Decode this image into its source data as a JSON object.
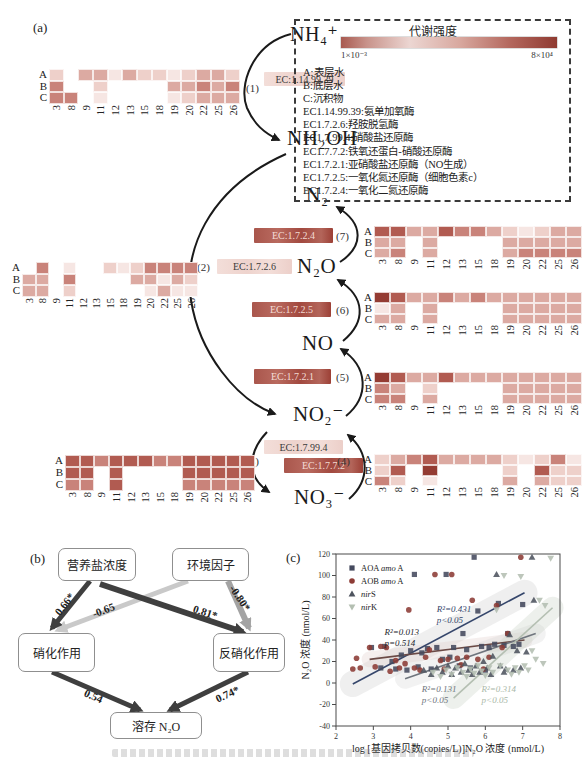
{
  "figure": {
    "label_a": "(a)",
    "label_b": "(b)",
    "label_c": "(c)"
  },
  "panel_a": {
    "compounds": {
      "nh4": "NH₄⁺",
      "nh2oh": "NH₂OH",
      "n2": "N₂",
      "n2o": "N₂O",
      "no": "NO",
      "no2": "NO₂⁻",
      "no3": "NO₃⁻"
    },
    "steps": {
      "s1": "(1)",
      "s2": "(2)",
      "s3": "(3)",
      "s4": "(4)",
      "s5": "(5)",
      "s6": "(6)",
      "s7": "(7)"
    },
    "ec": {
      "e1": "EC:1.14.99.39",
      "e2": "EC:1.7.2.6",
      "e3": "EC:1.7.99.4",
      "e4": "EC:1.7.7.2",
      "e5": "EC:1.7.2.1",
      "e6": "EC:1.7.2.5",
      "e7": "EC:1.7.2.4"
    },
    "legend": {
      "title": "代谢强度",
      "min": "1×10⁻³",
      "max": "8×10⁴",
      "lines": [
        "A:表层水",
        "B:底层水",
        "C:沉积物",
        "EC1.14.99.39:氨单加氧酶",
        "EC1.7.2.6:羟胺脱氢酶",
        "EC1.7.99.4:硝酸盐还原酶",
        "EC1.7.7.2:铁氧还蛋白-硝酸还原酶",
        "EC1.7.2.1:亚硝酸盐还原酶（NO生成）",
        "EC1.7.2.5:一氧化氮还原酶（细胞色素c）",
        "EC1.7.2.4:一氧化二氮还原酶"
      ]
    },
    "palette": [
      "transparent",
      "#f6e6e3",
      "#eed0ca",
      "#dcaaa2",
      "#c9837a",
      "#b15b51",
      "#943c33"
    ],
    "heatmap_rows": [
      "A",
      "B",
      "C"
    ],
    "heatmap_columns": [
      "3",
      "8",
      "9",
      "11",
      "12",
      "13",
      "15",
      "18",
      "19",
      "20",
      "22",
      "25",
      "26"
    ],
    "heatmaps": [
      {
        "name": "ammonia-monooxygenase-left",
        "values": [
          [
            2,
            0,
            3,
            3,
            1,
            3,
            2,
            2,
            1,
            2,
            3,
            3,
            2
          ],
          [
            4,
            0,
            0,
            2,
            0,
            0,
            0,
            0,
            3,
            3,
            4,
            3,
            4
          ],
          [
            4,
            4,
            0,
            1,
            0,
            0,
            0,
            0,
            1,
            2,
            3,
            3,
            3
          ]
        ]
      },
      {
        "name": "hydroxylamine-dehydrogenase-left",
        "values": [
          [
            0,
            4,
            0,
            1,
            0,
            0,
            2,
            1,
            2,
            4,
            4,
            4,
            4
          ],
          [
            3,
            3,
            0,
            4,
            0,
            0,
            0,
            0,
            3,
            3,
            1,
            3,
            2
          ],
          [
            3,
            3,
            0,
            2,
            0,
            0,
            0,
            0,
            0,
            1,
            3,
            1,
            1
          ]
        ]
      },
      {
        "name": "nitrate-reductase-left-bottom",
        "values": [
          [
            5,
            5,
            4,
            5,
            5,
            5,
            4,
            4,
            5,
            5,
            5,
            5,
            5
          ],
          [
            5,
            5,
            0,
            5,
            0,
            0,
            0,
            0,
            5,
            5,
            5,
            5,
            5
          ],
          [
            4,
            4,
            0,
            5,
            0,
            0,
            0,
            0,
            4,
            4,
            4,
            4,
            4
          ]
        ]
      },
      {
        "name": "nitrous-oxide-reductase-right",
        "values": [
          [
            5,
            5,
            3,
            3,
            5,
            4,
            4,
            3,
            2,
            1,
            2,
            3,
            3
          ],
          [
            3,
            3,
            0,
            3,
            0,
            0,
            0,
            0,
            3,
            3,
            3,
            3,
            3
          ],
          [
            3,
            4,
            0,
            3,
            0,
            0,
            0,
            0,
            3,
            4,
            4,
            4,
            4
          ]
        ]
      },
      {
        "name": "nitric-oxide-reductase-right",
        "values": [
          [
            6,
            5,
            3,
            3,
            4,
            3,
            4,
            3,
            3,
            3,
            3,
            3,
            3
          ],
          [
            1,
            3,
            0,
            3,
            0,
            0,
            0,
            0,
            3,
            3,
            3,
            3,
            3
          ],
          [
            3,
            3,
            0,
            3,
            0,
            0,
            0,
            0,
            3,
            3,
            3,
            3,
            3
          ]
        ]
      },
      {
        "name": "nitrite-reductase-right",
        "values": [
          [
            6,
            5,
            3,
            3,
            5,
            3,
            3,
            3,
            3,
            3,
            3,
            3,
            3
          ],
          [
            4,
            3,
            0,
            2,
            0,
            0,
            0,
            0,
            3,
            3,
            3,
            3,
            3
          ],
          [
            4,
            4,
            0,
            3,
            0,
            0,
            0,
            0,
            3,
            3,
            3,
            3,
            3
          ]
        ]
      },
      {
        "name": "nitrate-interconversion-right-bottom",
        "values": [
          [
            2,
            3,
            4,
            5,
            3,
            3,
            3,
            3,
            2,
            1,
            2,
            4,
            1
          ],
          [
            2,
            5,
            0,
            6,
            0,
            0,
            0,
            0,
            2,
            0,
            5,
            2,
            2
          ],
          [
            4,
            2,
            0,
            1,
            0,
            0,
            0,
            0,
            3,
            0,
            3,
            2,
            2
          ]
        ]
      }
    ]
  },
  "panel_b": {
    "boxes": {
      "nutrient": "营养盐浓度",
      "environment": "环境因子",
      "nitrification": "硝化作用",
      "denitrification": "反硝化作用",
      "n2o": "溶存 N₂O"
    },
    "coefficients": {
      "nutrient_nitrification": "0.66*",
      "environment_nitrification": "-0.65",
      "nutrient_denitrification": "0.81*",
      "environment_denitrification": "-0.80*",
      "nitrification_n2o": "0.54",
      "denitrification_n2o": "0.74*"
    },
    "arrow_colors": {
      "strong_dark": "#3f3f3f",
      "light_gray": "#c9c9c9",
      "mid_gray": "#a3a3a3"
    }
  },
  "chart_data": {
    "type": "scatter",
    "xlabel": "log [基因拷贝数(copies/L)]N₂O 浓度 (nmol/L)",
    "ylabel": "N₂O 浓度 (nmol/L)",
    "xlim": [
      2,
      8
    ],
    "ylim": [
      -40,
      120
    ],
    "xticks": [
      2,
      3,
      4,
      5,
      6,
      7,
      8
    ],
    "yticks": [
      -40,
      -20,
      0,
      20,
      40,
      60,
      80,
      100,
      120
    ],
    "grid": false,
    "legend_position": "top-left",
    "series": [
      {
        "key": "aoa-amoa",
        "legend_pre": "AOA ",
        "legend_italic": "amo",
        "legend_suf": " A",
        "marker": "square",
        "color": "#454a5e",
        "fit": [
          2.45,
          -1,
          7.05,
          84
        ],
        "line_color": "#35466b",
        "band_color": "#cfcfcf",
        "band_width": 26,
        "annotation": {
          "lines": [
            "R²=0.431",
            "p<0.05"
          ],
          "x": 4.7,
          "y": 66,
          "color": "#35466b"
        },
        "points": [
          [
            2.95,
            33
          ],
          [
            3.2,
            14
          ],
          [
            3.3,
            34
          ],
          [
            3.5,
            20
          ],
          [
            3.6,
            13
          ],
          [
            3.75,
            26
          ],
          [
            3.9,
            12
          ],
          [
            4.0,
            30
          ],
          [
            4.1,
            101
          ],
          [
            4.2,
            15
          ],
          [
            4.3,
            28
          ],
          [
            4.45,
            32
          ],
          [
            4.55,
            13
          ],
          [
            4.7,
            33
          ],
          [
            4.85,
            22
          ],
          [
            4.95,
            101
          ],
          [
            5.05,
            24
          ],
          [
            5.15,
            33
          ],
          [
            5.3,
            16
          ],
          [
            5.4,
            46
          ],
          [
            5.5,
            31
          ],
          [
            5.6,
            14
          ],
          [
            5.7,
            117
          ],
          [
            5.8,
            67
          ],
          [
            5.9,
            34
          ],
          [
            6.0,
            12
          ],
          [
            6.1,
            33
          ],
          [
            6.25,
            36
          ],
          [
            6.35,
            74
          ],
          [
            6.5,
            35
          ],
          [
            6.6,
            46
          ],
          [
            6.75,
            34
          ],
          [
            6.9,
            36
          ],
          [
            7.0,
            73
          ]
        ]
      },
      {
        "key": "aob-amoa",
        "legend_pre": "AOB ",
        "legend_italic": "amo",
        "legend_suf": " A",
        "marker": "circle",
        "color": "#8d3c36",
        "fit": [
          2.9,
          22,
          7.05,
          40
        ],
        "line_color": "#6b4a46",
        "band_color": "#e2cfcc",
        "band_width": 16,
        "annotation": {
          "lines": [
            "R²=0.013",
            "p=0.514"
          ],
          "x": 3.3,
          "y": 45,
          "color": "#26262e"
        },
        "points": [
          [
            2.45,
            13
          ],
          [
            2.55,
            23
          ],
          [
            2.65,
            14
          ],
          [
            2.9,
            33
          ],
          [
            3.05,
            15
          ],
          [
            3.2,
            34
          ],
          [
            3.35,
            33
          ],
          [
            3.45,
            11
          ],
          [
            3.6,
            21
          ],
          [
            3.7,
            14
          ],
          [
            3.85,
            18
          ],
          [
            3.95,
            68
          ],
          [
            4.1,
            14
          ],
          [
            4.25,
            12
          ],
          [
            4.4,
            24
          ],
          [
            4.5,
            31
          ],
          [
            4.65,
            101
          ],
          [
            4.8,
            21
          ],
          [
            4.9,
            13
          ],
          [
            5.0,
            22
          ],
          [
            5.1,
            101
          ],
          [
            5.25,
            23
          ],
          [
            5.35,
            17
          ],
          [
            5.5,
            24
          ],
          [
            5.65,
            77
          ],
          [
            5.8,
            22
          ],
          [
            5.95,
            13
          ],
          [
            6.1,
            24
          ],
          [
            6.3,
            72
          ],
          [
            6.45,
            33
          ],
          [
            6.6,
            46
          ],
          [
            6.95,
            117
          ]
        ]
      },
      {
        "key": "nirs",
        "legend_pre": "",
        "legend_italic": "nir",
        "legend_suf": "S",
        "marker": "triangle-up",
        "color": "#4e545f",
        "fit": [
          3.85,
          4,
          7.35,
          46
        ],
        "line_color": "#6f757d",
        "band_color": "#d8d8d8",
        "band_width": 20,
        "annotation": {
          "lines": [
            "R²=0.131",
            "p<0.05"
          ],
          "x": 4.3,
          "y": -8,
          "color": "#6f757d"
        },
        "points": [
          [
            4.35,
            12
          ],
          [
            4.55,
            8
          ],
          [
            4.7,
            14
          ],
          [
            4.85,
            10
          ],
          [
            5.0,
            16
          ],
          [
            5.1,
            8
          ],
          [
            5.2,
            14
          ],
          [
            5.35,
            10
          ],
          [
            5.45,
            18
          ],
          [
            5.55,
            12
          ],
          [
            5.65,
            8
          ],
          [
            5.75,
            16
          ],
          [
            5.85,
            10
          ],
          [
            5.95,
            20
          ],
          [
            6.05,
            14
          ],
          [
            6.15,
            8
          ],
          [
            6.2,
            25
          ],
          [
            6.3,
            101
          ],
          [
            6.4,
            16
          ],
          [
            6.5,
            10
          ],
          [
            6.55,
            13
          ],
          [
            6.65,
            45
          ],
          [
            6.75,
            12
          ],
          [
            6.85,
            30
          ],
          [
            6.95,
            14
          ],
          [
            7.1,
            29
          ],
          [
            7.25,
            117
          ],
          [
            7.3,
            77
          ]
        ]
      },
      {
        "key": "nirk",
        "legend_pre": "",
        "legend_italic": "nir",
        "legend_suf": "K",
        "marker": "triangle-down",
        "color": "#b4bfb2",
        "fit": [
          5.15,
          -14,
          7.8,
          70
        ],
        "line_color": "#b4bfb2",
        "band_color": "#c7d2c5",
        "band_width": 22,
        "annotation": {
          "lines": [
            "R²=0.314",
            "p<0.05"
          ],
          "x": 5.9,
          "y": -8,
          "color": "#aab8a8"
        },
        "points": [
          [
            4.6,
            10
          ],
          [
            4.8,
            6
          ],
          [
            4.95,
            12
          ],
          [
            5.1,
            8
          ],
          [
            5.25,
            14
          ],
          [
            5.4,
            10
          ],
          [
            5.5,
            6
          ],
          [
            5.6,
            13
          ],
          [
            5.7,
            9
          ],
          [
            5.8,
            16
          ],
          [
            5.9,
            11
          ],
          [
            6.0,
            7
          ],
          [
            6.1,
            14
          ],
          [
            6.2,
            10
          ],
          [
            6.3,
            68
          ],
          [
            6.4,
            16
          ],
          [
            6.5,
            100
          ],
          [
            6.6,
            12
          ],
          [
            6.7,
            8
          ],
          [
            6.8,
            14
          ],
          [
            6.9,
            10
          ],
          [
            6.95,
            99
          ],
          [
            7.05,
            16
          ],
          [
            7.15,
            12
          ],
          [
            7.25,
            30
          ],
          [
            7.35,
            22
          ],
          [
            7.45,
            77
          ],
          [
            7.55,
            18
          ],
          [
            7.6,
            72
          ],
          [
            7.75,
            116
          ]
        ]
      }
    ]
  }
}
